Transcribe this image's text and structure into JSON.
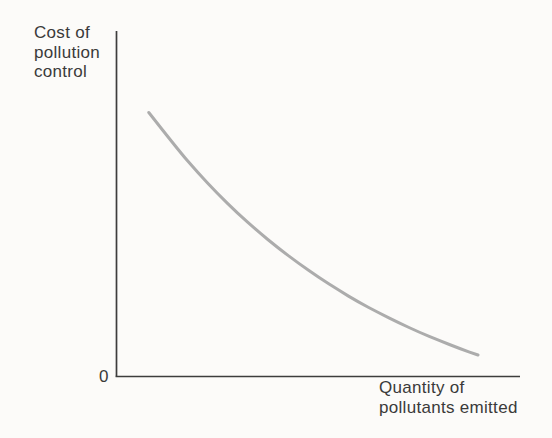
{
  "figure": {
    "background": "#fcfbf9"
  },
  "chart_data": {
    "type": "line",
    "title": "",
    "xlabel": "Quantity of pollutants emitted",
    "ylabel": "Cost of pollution control",
    "xlabel_display": "Quantity of\npollutants emitted",
    "ylabel_display": "Cost of\npollution\ncontrol",
    "origin_label": "0",
    "xlim": [
      0,
      100
    ],
    "ylim": [
      0,
      100
    ],
    "x_ticks": [],
    "y_ticks": [],
    "grid": false,
    "legend": null,
    "axes_shown": [
      "left",
      "bottom"
    ],
    "colors": {
      "axis": "#3d3d3d",
      "curve": "#acacac",
      "text": "#3a3a3a"
    },
    "series": [
      {
        "name": "cost of pollution control",
        "type": "line",
        "x": [
          8,
          15,
          20,
          25,
          30,
          35,
          40,
          45,
          50,
          55,
          60,
          65,
          70,
          75,
          80,
          85,
          89.6
        ],
        "y": [
          76.3,
          65.9,
          59.1,
          52.9,
          47.2,
          42.0,
          37.2,
          32.8,
          28.7,
          25.0,
          21.5,
          18.4,
          15.5,
          12.8,
          10.4,
          8.1,
          6.2
        ]
      }
    ]
  }
}
